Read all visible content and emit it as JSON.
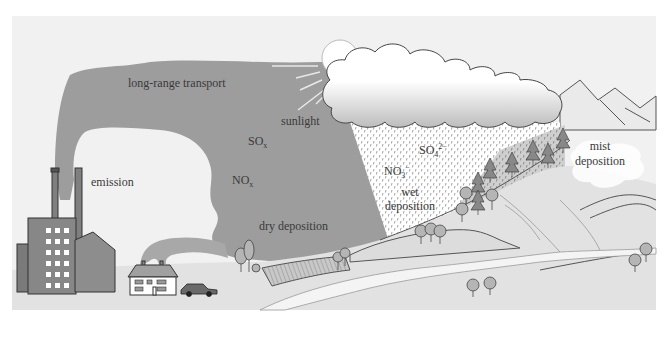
{
  "diagram": {
    "labels": {
      "long_range_transport": "long-range transport",
      "sunlight": "sunlight",
      "sox_main": "SO",
      "sox_sub": "x",
      "nox_main": "NO",
      "nox_sub": "x",
      "emission": "emission",
      "dry_deposition": "dry deposition",
      "so4_main": "SO",
      "so4_sub": "4",
      "so4_sup": "2−",
      "no3_main": "NO",
      "no3_sub": "3",
      "no3_sup": "−",
      "wet": "wet",
      "wet_deposition": "deposition",
      "mist": "mist",
      "mist_deposition": "deposition"
    },
    "elements": [
      "factory",
      "smokestacks",
      "house",
      "car",
      "sun",
      "rain-cloud",
      "mountains",
      "forest",
      "fields",
      "river",
      "mist-cloud"
    ],
    "colors": {
      "background": "#f1f1f1",
      "plume": "#9d9d9d",
      "ground": "#e2e2e2",
      "cloud": "#ffffff",
      "cloud_shadow": "#cfcfcf",
      "building": "#808080",
      "text": "#3a3a3a"
    }
  }
}
